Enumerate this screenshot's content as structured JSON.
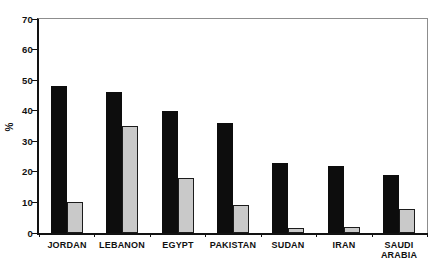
{
  "chart_data": {
    "type": "bar",
    "title": "",
    "xlabel": "",
    "ylabel": "%",
    "ylim": [
      0,
      70
    ],
    "yticks": [
      0,
      10,
      20,
      30,
      40,
      50,
      60,
      70
    ],
    "grid": false,
    "legend": "none",
    "background": "#ffffff",
    "axis_color": "#121212",
    "categories": [
      "JORDAN",
      "LEBANON",
      "EGYPT",
      "PAKISTAN",
      "SUDAN",
      "IRAN",
      "SAUDI ARABIA"
    ],
    "series": [
      {
        "name": "black-bars",
        "color": "#0d0d0d",
        "values": [
          48,
          46,
          40,
          36,
          23,
          22,
          19
        ]
      },
      {
        "name": "gray-bars",
        "color": "#c9c9c9",
        "border_color": "#1c1c1c",
        "values": [
          10,
          35,
          18,
          9,
          1.5,
          2,
          8
        ]
      }
    ]
  }
}
